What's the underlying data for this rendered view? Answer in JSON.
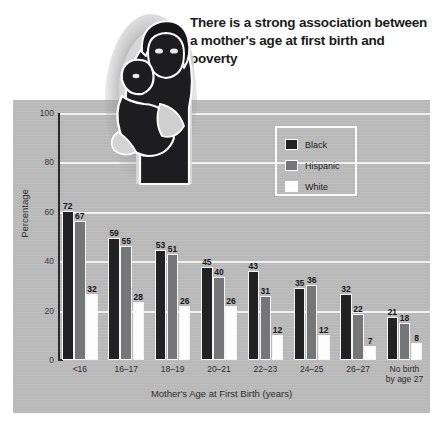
{
  "headline": "There is a strong association between a mother's age at first birth and poverty",
  "illustration": {
    "name": "mother-and-baby-illustration",
    "description": "Stylized illustration of a mother holding a baby"
  },
  "legend": {
    "position": "inside-top-right",
    "entries": [
      {
        "label": "Black",
        "color": "#222124"
      },
      {
        "label": "Hispanic",
        "color": "#757678"
      },
      {
        "label": "White",
        "color": "#fdfdfd"
      }
    ]
  },
  "chart_data": {
    "type": "bar",
    "title": "There is a strong association between a mother's age at first birth and poverty",
    "xlabel": "Mother's Age at First Birth (years)",
    "ylabel": "Percentage",
    "ylim": [
      0,
      100
    ],
    "yticks": [
      0,
      20,
      40,
      60,
      80,
      100
    ],
    "grid": true,
    "legend_position": "inside-top-right",
    "categories": [
      "<16",
      "16–17",
      "18–19",
      "20–21",
      "22–23",
      "24–25",
      "26–27",
      "No birth by age 27"
    ],
    "category_lines": [
      [
        "<16"
      ],
      [
        "16–17"
      ],
      [
        "18–19"
      ],
      [
        "20–21"
      ],
      [
        "22–23"
      ],
      [
        "24–25"
      ],
      [
        "26–27"
      ],
      [
        "No birth",
        "by age 27"
      ]
    ],
    "series": [
      {
        "name": "Black",
        "color": "#222124",
        "values": [
          72,
          59,
          53,
          45,
          43,
          35,
          32,
          21
        ]
      },
      {
        "name": "Hispanic",
        "color": "#757678",
        "values": [
          67,
          55,
          51,
          40,
          31,
          36,
          22,
          18
        ]
      },
      {
        "name": "White",
        "color": "#fdfdfd",
        "values": [
          32,
          28,
          26,
          26,
          12,
          12,
          7,
          8
        ]
      }
    ]
  },
  "colors": {
    "panel_background": "#bcbcbc",
    "gridline": "#f2f2f2",
    "axis": "#2a2a2a",
    "text": "#222222"
  }
}
